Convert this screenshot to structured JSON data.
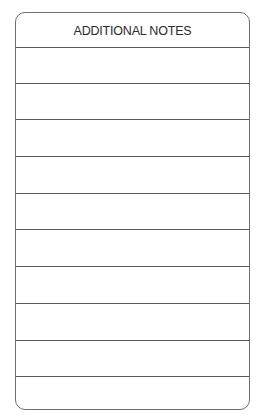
{
  "form": {
    "title": "ADDITIONAL NOTES",
    "rule_positions": [
      34,
      70,
      106,
      143,
      180,
      216,
      253,
      290,
      327,
      363
    ],
    "line_count": 10,
    "border_color": "#6f6f6f",
    "rule_color": "#5a5a5a"
  }
}
